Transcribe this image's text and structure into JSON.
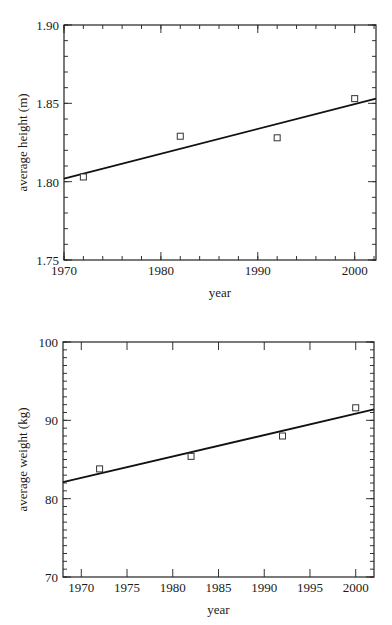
{
  "chart_data": [
    {
      "type": "scatter",
      "title": "",
      "xlabel": "year",
      "ylabel": "average height (m)",
      "xlim": [
        1970,
        2002.2
      ],
      "ylim": [
        1.75,
        1.9
      ],
      "grid": false,
      "legend": null,
      "x_ticks": [
        1970,
        1980,
        1990,
        2000
      ],
      "x_tick_labels": [
        "1970",
        "1980",
        "1990",
        "2000"
      ],
      "x_minor_step": 2,
      "y_ticks": [
        1.75,
        1.8,
        1.85,
        1.9
      ],
      "y_tick_labels": [
        "1.75",
        "1.80",
        "1.85",
        "1.90"
      ],
      "y_minor_step": 0.01,
      "series": [
        {
          "name": "average height",
          "marker": "open-square",
          "x": [
            1972,
            1982,
            1992,
            2000
          ],
          "y": [
            1.803,
            1.829,
            1.828,
            1.853
          ]
        }
      ],
      "fit_line": {
        "x": [
          1970,
          2002.2
        ],
        "y": [
          1.802,
          1.853
        ]
      }
    },
    {
      "type": "scatter",
      "title": "",
      "xlabel": "year",
      "ylabel": "average weight (kg)",
      "xlim": [
        1968,
        2002
      ],
      "ylim": [
        70,
        100
      ],
      "grid": false,
      "legend": null,
      "x_ticks": [
        1970,
        1975,
        1980,
        1985,
        1990,
        1995,
        2000
      ],
      "x_tick_labels": [
        "1970",
        "1975",
        "1980",
        "1985",
        "1990",
        "1995",
        "2000"
      ],
      "x_minor_step": null,
      "y_ticks": [
        70,
        80,
        90,
        100
      ],
      "y_tick_labels": [
        "70",
        "80",
        "90",
        "100"
      ],
      "y_minor_step": 1,
      "series": [
        {
          "name": "average weight",
          "marker": "open-square",
          "x": [
            1972,
            1982,
            1992,
            2000
          ],
          "y": [
            83.8,
            85.4,
            88.0,
            91.6
          ]
        }
      ],
      "fit_line": {
        "x": [
          1968,
          2002
        ],
        "y": [
          82.1,
          91.4
        ]
      }
    }
  ],
  "layout": [
    {
      "frame": {
        "left": 64,
        "top": 25,
        "right": 376,
        "bottom": 260
      }
    },
    {
      "frame": {
        "left": 63,
        "top": 30,
        "right": 374,
        "bottom": 265
      }
    }
  ]
}
